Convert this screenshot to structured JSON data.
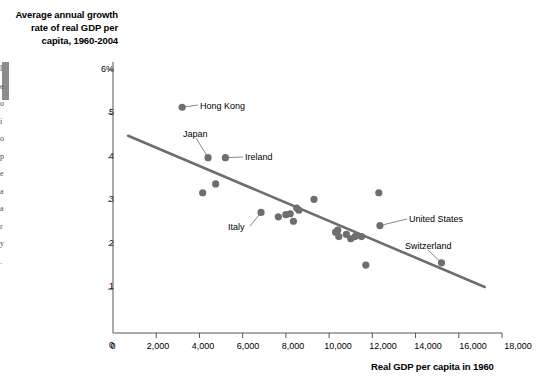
{
  "chart_data": {
    "type": "scatter",
    "title": "Average annual growth rate of real GDP per capita, 1960-2004",
    "xlabel": "Real GDP per capita in 1960",
    "ylabel": "",
    "xlim": [
      0,
      18000
    ],
    "ylim": [
      0,
      6
    ],
    "grid": false,
    "legend": "none",
    "xticks": [
      {
        "value": 0,
        "label": "0"
      },
      {
        "value": 2000,
        "label": "2,000"
      },
      {
        "value": 4000,
        "label": "4,000"
      },
      {
        "value": 6000,
        "label": "6,000"
      },
      {
        "value": 8000,
        "label": "8,000"
      },
      {
        "value": 10000,
        "label": "10,000"
      },
      {
        "value": 12000,
        "label": "12,000"
      },
      {
        "value": 14000,
        "label": "14,000"
      },
      {
        "value": 16000,
        "label": "16,000"
      },
      {
        "value": 18000,
        "label": "18,000"
      }
    ],
    "yticks": [
      {
        "value": 0,
        "label": "0"
      },
      {
        "value": 1,
        "label": "1"
      },
      {
        "value": 2,
        "label": "2"
      },
      {
        "value": 3,
        "label": "3"
      },
      {
        "value": 4,
        "label": "4"
      },
      {
        "value": 5,
        "label": "5"
      },
      {
        "value": 6,
        "label": "6%"
      }
    ],
    "points": [
      {
        "x": 3200,
        "y": 5.15,
        "label": "Hong Kong"
      },
      {
        "x": 4400,
        "y": 4.0,
        "label": "Japan"
      },
      {
        "x": 5200,
        "y": 4.0,
        "label": "Ireland"
      },
      {
        "x": 4150,
        "y": 3.2,
        "label": ""
      },
      {
        "x": 4750,
        "y": 3.4,
        "label": ""
      },
      {
        "x": 6850,
        "y": 2.75,
        "label": "Italy"
      },
      {
        "x": 7650,
        "y": 2.65,
        "label": ""
      },
      {
        "x": 8000,
        "y": 2.7,
        "label": ""
      },
      {
        "x": 8200,
        "y": 2.72,
        "label": ""
      },
      {
        "x": 8350,
        "y": 2.55,
        "label": ""
      },
      {
        "x": 8500,
        "y": 2.85,
        "label": ""
      },
      {
        "x": 8600,
        "y": 2.8,
        "label": ""
      },
      {
        "x": 9300,
        "y": 3.05,
        "label": ""
      },
      {
        "x": 10300,
        "y": 2.3,
        "label": ""
      },
      {
        "x": 10400,
        "y": 2.35,
        "label": ""
      },
      {
        "x": 10450,
        "y": 2.2,
        "label": ""
      },
      {
        "x": 10800,
        "y": 2.25,
        "label": ""
      },
      {
        "x": 11000,
        "y": 2.15,
        "label": ""
      },
      {
        "x": 11200,
        "y": 2.2,
        "label": ""
      },
      {
        "x": 11500,
        "y": 2.2,
        "label": ""
      },
      {
        "x": 11700,
        "y": 1.55,
        "label": ""
      },
      {
        "x": 12300,
        "y": 3.2,
        "label": ""
      },
      {
        "x": 12350,
        "y": 2.45,
        "label": "United States"
      },
      {
        "x": 15200,
        "y": 1.6,
        "label": "Switzerland"
      }
    ],
    "trendline": {
      "x1": 700,
      "y1": 4.5,
      "x2": 17200,
      "y2": 1.05
    },
    "annotations": [
      {
        "text": "Hong Kong",
        "anchor_x": 3200,
        "anchor_y": 5.15
      },
      {
        "text": "Japan",
        "anchor_x": 4400,
        "anchor_y": 4.0
      },
      {
        "text": "Ireland",
        "anchor_x": 5200,
        "anchor_y": 4.0
      },
      {
        "text": "Italy",
        "anchor_x": 6850,
        "anchor_y": 2.75
      },
      {
        "text": "United States",
        "anchor_x": 12350,
        "anchor_y": 2.45
      },
      {
        "text": "Switzerland",
        "anchor_x": 15200,
        "anchor_y": 1.6
      }
    ],
    "colors": {
      "marker": "#6e6e6e",
      "trendline": "#6e6e6e",
      "axis": "#555555",
      "text": "#000000"
    }
  },
  "labels": {
    "hong_kong": "Hong Kong",
    "japan": "Japan",
    "ireland": "Ireland",
    "italy": "Italy",
    "united_states": "United States",
    "switzerland": "Switzerland"
  },
  "ticks_y": {
    "t6": "6%",
    "t5": "5",
    "t4": "4",
    "t3": "3",
    "t2": "2",
    "t1": "1",
    "t0": "0"
  },
  "ticks_x": {
    "t0": "0",
    "t2000": "2,000",
    "t4000": "4,000",
    "t6000": "6,000",
    "t8000": "8,000",
    "t10000": "10,000",
    "t12000": "12,000",
    "t14000": "14,000",
    "t16000": "16,000",
    "t18000": "18,000"
  },
  "titles": {
    "chart": "Average annual growth rate of real GDP per capita, 1960-2004",
    "x_axis": "Real GDP per capita in 1960"
  }
}
